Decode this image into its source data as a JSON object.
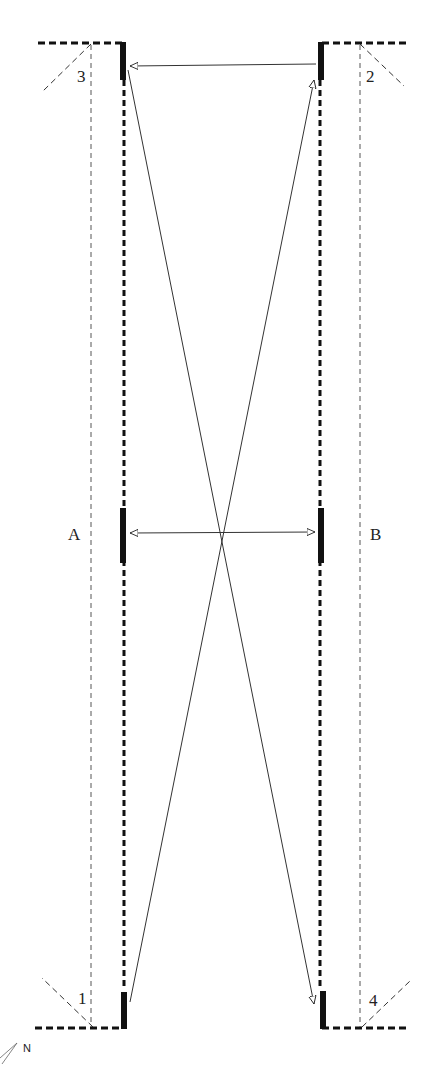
{
  "diagram": {
    "type": "plan-view layout",
    "colors": {
      "ink": "#111111",
      "thin": "#333333",
      "faint": "#555555",
      "background": "#ffffff"
    },
    "side_labels": {
      "left": "A",
      "right": "B"
    },
    "corner_labels": {
      "top_left": "3",
      "top_right": "2",
      "bottom_left": "1",
      "bottom_right": "4"
    },
    "north_label": "N",
    "elements": [
      {
        "id": "left-wall",
        "desc": "heavy dashed vertical boundary A side"
      },
      {
        "id": "right-wall",
        "desc": "heavy dashed vertical boundary B side"
      },
      {
        "id": "left-offset-line",
        "desc": "thin dashed vertical offset line"
      },
      {
        "id": "right-offset-line",
        "desc": "thin dashed vertical offset line"
      },
      {
        "id": "horizontal-arrow-top",
        "desc": "arrow from top-right marker to top-left marker"
      },
      {
        "id": "horizontal-arrow-middle",
        "desc": "double-headed arrow between middle markers"
      },
      {
        "id": "diagonal-1",
        "desc": "line from top-left marker to bottom-right marker (arrowhead at bottom)"
      },
      {
        "id": "diagonal-2",
        "desc": "line from bottom-left marker to top-right marker (arrowhead at top)"
      }
    ]
  }
}
